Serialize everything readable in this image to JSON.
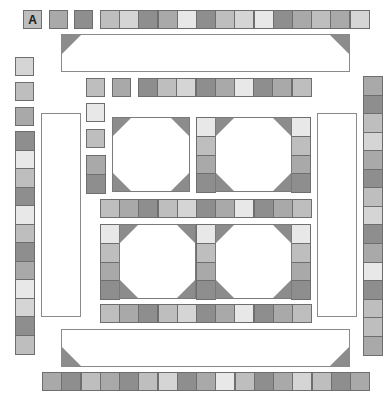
{
  "palette": {
    "dark": "#8e8e8e",
    "mid": "#a9a9a9",
    "midlight": "#bebebe",
    "light": "#d5d5d5",
    "lightest": "#e8e8e8",
    "corner": "#8c8c8c",
    "border": "#6e6e6e"
  },
  "board": {
    "label_tile": {
      "text": "A",
      "shade": "midlight",
      "x": 23,
      "y": 10,
      "w": 19,
      "h": 19
    },
    "single_tiles": [
      {
        "x": 49,
        "y": 10,
        "shade": "mid"
      },
      {
        "x": 74,
        "y": 10,
        "shade": "dark"
      },
      {
        "x": 15,
        "y": 57,
        "shade": "light"
      },
      {
        "x": 15,
        "y": 82,
        "shade": "midlight"
      },
      {
        "x": 15,
        "y": 107,
        "shade": "mid"
      },
      {
        "x": 86,
        "y": 78,
        "shade": "midlight"
      },
      {
        "x": 86,
        "y": 103,
        "shade": "lightest"
      },
      {
        "x": 86,
        "y": 129,
        "shade": "midlight"
      },
      {
        "x": 112,
        "y": 78,
        "shade": "mid"
      }
    ],
    "rows": [
      {
        "name": "top-row",
        "x": 100,
        "y": 10,
        "dir": "h",
        "size": 19.2,
        "shades": [
          "midlight",
          "light",
          "dark",
          "mid",
          "lightest",
          "dark",
          "midlight",
          "light",
          "lightest",
          "dark",
          "mid",
          "midlight",
          "mid",
          "light"
        ]
      },
      {
        "name": "second-row",
        "x": 138,
        "y": 78,
        "dir": "h",
        "size": 19.2,
        "shades": [
          "dark",
          "midlight",
          "light",
          "dark",
          "mid",
          "lightest",
          "dark",
          "mid",
          "midlight"
        ]
      },
      {
        "name": "middle-row",
        "x": 100,
        "y": 199,
        "dir": "h",
        "size": 19.2,
        "shades": [
          "midlight",
          "mid",
          "dark",
          "midlight",
          "light",
          "dark",
          "mid",
          "lightest",
          "dark",
          "mid",
          "midlight"
        ]
      },
      {
        "name": "lower-row",
        "x": 100,
        "y": 304,
        "dir": "h",
        "size": 19.2,
        "shades": [
          "midlight",
          "mid",
          "dark",
          "midlight",
          "light",
          "dark",
          "mid",
          "lightest",
          "dark",
          "mid",
          "midlight"
        ]
      },
      {
        "name": "bottom-row",
        "x": 42,
        "y": 372,
        "dir": "h",
        "size": 19.25,
        "shades": [
          "mid",
          "dark",
          "midlight",
          "mid",
          "dark",
          "midlight",
          "light",
          "dark",
          "mid",
          "lightest",
          "midlight",
          "dark",
          "mid",
          "light",
          "midlight",
          "dark",
          "mid"
        ]
      },
      {
        "name": "left-column",
        "x": 15,
        "y": 131,
        "dir": "v",
        "size": 18.5,
        "shades": [
          "dark",
          "lightest",
          "midlight",
          "dark",
          "lightest",
          "midlight",
          "dark",
          "mid",
          "lightest",
          "light",
          "dark",
          "midlight"
        ]
      },
      {
        "name": "right-column",
        "x": 363,
        "y": 76,
        "dir": "v",
        "size": 18.55,
        "shades": [
          "mid",
          "dark",
          "midlight",
          "light",
          "mid",
          "dark",
          "midlight",
          "light",
          "dark",
          "mid",
          "lightest",
          "dark",
          "midlight",
          "midlight",
          "mid"
        ]
      },
      {
        "name": "inner-left-column",
        "x": 86,
        "y": 155,
        "dir": "v",
        "size": 19,
        "shades": [
          "mid",
          "dark"
        ]
      }
    ],
    "panels": [
      {
        "name": "top-panel",
        "x": 61,
        "y": 34,
        "w": 289,
        "h": 38,
        "corners": [
          "tl",
          "tr"
        ]
      },
      {
        "name": "bottom-panel",
        "x": 61,
        "y": 329,
        "w": 289,
        "h": 38,
        "corners": [
          "bl",
          "br"
        ]
      },
      {
        "name": "left-panel",
        "x": 41,
        "y": 113,
        "w": 40,
        "h": 204,
        "corners": []
      },
      {
        "name": "right-panel",
        "x": 317,
        "y": 113,
        "w": 40,
        "h": 204,
        "corners": []
      }
    ],
    "blocks": [
      {
        "name": "block-top-left",
        "x": 112,
        "y": 117,
        "w": 78,
        "h": 75,
        "left_col": null,
        "right_col": null
      },
      {
        "name": "block-top-right",
        "x": 196,
        "y": 117,
        "w": 115,
        "h": 75,
        "left_col": [
          "lightest",
          "midlight",
          "mid",
          "dark"
        ],
        "right_col": [
          "lightest",
          "midlight",
          "mid",
          "dark"
        ]
      },
      {
        "name": "block-bottom-left",
        "x": 100,
        "y": 224,
        "w": 96,
        "h": 75,
        "left_col": [
          "lightest",
          "midlight",
          "mid",
          "dark"
        ],
        "right_col": null
      },
      {
        "name": "block-bottom-right",
        "x": 196,
        "y": 224,
        "w": 115,
        "h": 75,
        "left_col": [
          "lightest",
          "midlight",
          "mid",
          "dark"
        ],
        "right_col": [
          "lightest",
          "midlight",
          "mid",
          "dark"
        ]
      }
    ]
  }
}
